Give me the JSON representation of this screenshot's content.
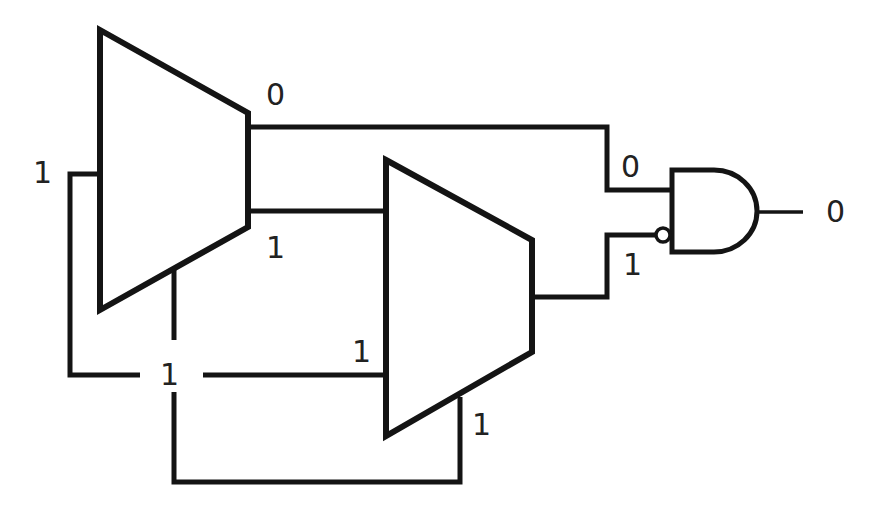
{
  "diagram": {
    "title": "",
    "colors": {
      "line": "#141414",
      "text": "#222222",
      "background": "#ffffff"
    },
    "components": [
      {
        "id": "mux1",
        "type": "multiplexer"
      },
      {
        "id": "mux2",
        "type": "multiplexer"
      },
      {
        "id": "and1",
        "type": "AND gate",
        "inverted_input": "lower"
      }
    ],
    "labels": {
      "mux1_out_top": "0",
      "mux1_out_bottom": "1",
      "mux1_select": "1",
      "feedback_cross": "1",
      "mux2_select_side": "1",
      "mux2_bottom": "1",
      "and_in_top": "0",
      "and_in_bottom": "1",
      "and_out": "0"
    }
  }
}
